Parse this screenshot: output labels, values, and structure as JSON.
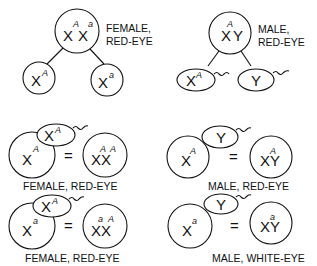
{
  "diagram": {
    "parents": {
      "female": {
        "genotype": [
          "X",
          "X"
        ],
        "alleles": [
          "A",
          "a"
        ],
        "label_line1": "FEMALE,",
        "label_line2": "RED-EYE",
        "gametes": [
          {
            "chromosome": "X",
            "allele": "A"
          },
          {
            "chromosome": "X",
            "allele": "a"
          }
        ]
      },
      "male": {
        "genotype": [
          "X",
          "Y"
        ],
        "alleles": [
          "A",
          ""
        ],
        "label_line1": "MALE,",
        "label_line2": "RED-EYE",
        "gametes": [
          {
            "chromosome": "X",
            "allele": "A"
          },
          {
            "chromosome": "Y",
            "allele": ""
          }
        ]
      }
    },
    "fertilizations": [
      {
        "egg": "X",
        "egg_allele": "A",
        "sperm": "X",
        "sperm_allele": "A",
        "equals": "=",
        "result": "XX",
        "result_alleles": [
          "A",
          "A"
        ],
        "label": "FEMALE, RED-EYE"
      },
      {
        "egg": "X",
        "egg_allele": "A",
        "sperm": "Y",
        "sperm_allele": "",
        "equals": "=",
        "result": "XY",
        "result_alleles": [
          "A",
          ""
        ],
        "label": "MALE, RED-EYE"
      },
      {
        "egg": "X",
        "egg_allele": "a",
        "sperm": "X",
        "sperm_allele": "A",
        "equals": "=",
        "result": "XX",
        "result_alleles": [
          "a",
          "A"
        ],
        "label": "FEMALE, RED-EYE"
      },
      {
        "egg": "X",
        "egg_allele": "a",
        "sperm": "Y",
        "sperm_allele": "",
        "equals": "=",
        "result": "XY",
        "result_alleles": [
          "a",
          ""
        ],
        "label": "MALE, WHITE-EYE"
      }
    ]
  }
}
